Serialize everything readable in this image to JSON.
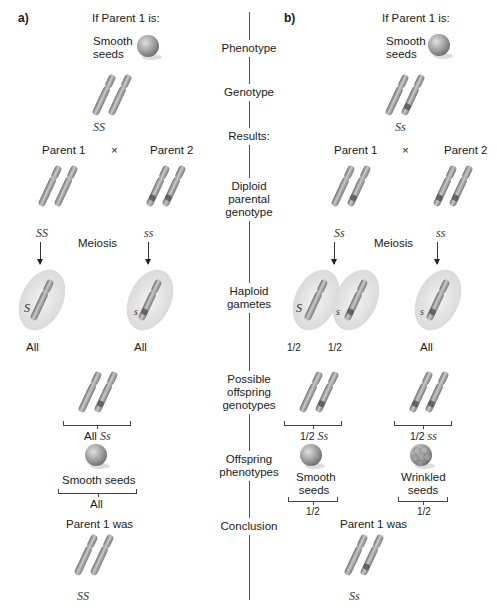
{
  "panel_a": {
    "label": "a)",
    "if_parent_is": "If Parent 1 is:",
    "phenotype_label": "Smooth\nseeds",
    "phenotype_line1": "Smooth",
    "phenotype_line2": "seeds",
    "genotype": "SS",
    "parent1": "Parent 1",
    "cross": "×",
    "parent2": "Parent 2",
    "parent1_genotype": "SS",
    "parent2_genotype": "ss",
    "meiosis": "Meiosis",
    "gamete1_allele": "S",
    "gamete2_allele": "s",
    "gamete1_fraction": "All",
    "gamete2_fraction": "All",
    "offspring_genotype_prefix": "All",
    "offspring_genotype": "Ss",
    "offspring_phenotype": "Smooth seeds",
    "offspring_phenotype_fraction": "All",
    "conclusion_label": "Parent 1 was",
    "conclusion_genotype": "SS"
  },
  "panel_b": {
    "label": "b)",
    "if_parent_is": "If Parent 1 is:",
    "phenotype_line1": "Smooth",
    "phenotype_line2": "seeds",
    "genotype": "Ss",
    "parent1": "Parent 1",
    "cross": "×",
    "parent2": "Parent 2",
    "parent1_genotype": "Ss",
    "parent2_genotype": "ss",
    "meiosis": "Meiosis",
    "gamete1_allele": "S",
    "gamete2_allele": "s",
    "gamete3_allele": "s",
    "gamete1_fraction": "1/2",
    "gamete2_fraction": "1/2",
    "gamete3_fraction": "All",
    "offspring1_genotype_prefix": "1/2",
    "offspring1_genotype": "Ss",
    "offspring2_genotype_prefix": "1/2",
    "offspring2_genotype": "ss",
    "offspring1_phenotype_line1": "Smooth",
    "offspring1_phenotype_line2": "seeds",
    "offspring2_phenotype_line1": "Wrinkled",
    "offspring2_phenotype_line2": "seeds",
    "offspring1_fraction": "1/2",
    "offspring2_fraction": "1/2",
    "conclusion_label": "Parent 1 was",
    "conclusion_genotype": "Ss"
  },
  "center_labels": {
    "phenotype": "Phenotype",
    "genotype": "Genotype",
    "results": "Results:",
    "diploid_1": "Diploid",
    "diploid_2": "parental",
    "diploid_3": "genotype",
    "haploid_1": "Haploid",
    "haploid_2": "gametes",
    "possible_1": "Possible",
    "possible_2": "offspring",
    "possible_3": "genotypes",
    "offspring_ph_1": "Offspring",
    "offspring_ph_2": "phenotypes",
    "conclusion": "Conclusion"
  },
  "colors": {
    "chromosome": "#9a9a9a",
    "seed": "#a8a8a8",
    "gamete_halo": "#e4e4e4",
    "divider": "#555555"
  }
}
